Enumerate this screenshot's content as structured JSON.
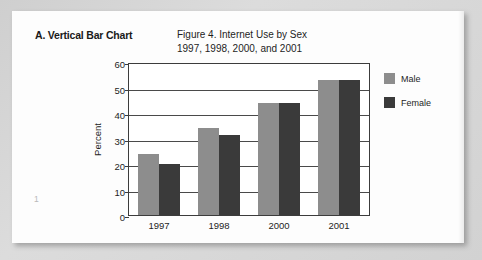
{
  "panel": {
    "heading": "A. Vertical Bar Chart",
    "page_number": "1"
  },
  "chart_data": {
    "type": "bar",
    "title": "Figure 4. Internet Use by Sex",
    "subtitle": "1997, 1998, 2000, and 2001",
    "xlabel": "",
    "ylabel": "Percent",
    "categories": [
      "1997",
      "1998",
      "2000",
      "2001"
    ],
    "series": [
      {
        "name": "Male",
        "color": "#8d8d8d",
        "values": [
          24,
          34,
          44,
          53
        ]
      },
      {
        "name": "Female",
        "color": "#3a3a3a",
        "values": [
          20,
          31.5,
          44,
          53
        ]
      }
    ],
    "ylim": [
      0,
      60
    ],
    "yticks": [
      "0",
      "10",
      "20",
      "30",
      "40",
      "50",
      "60"
    ],
    "grid": true,
    "legend_position": "right"
  }
}
